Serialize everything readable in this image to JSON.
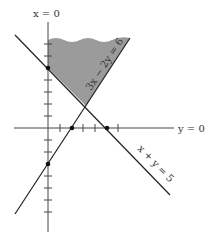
{
  "diagram": {
    "type": "linear-inequality-region",
    "axes": {
      "vertical_label": "x = 0",
      "horizontal_label": "y = 0"
    },
    "lines": [
      {
        "label": "3x − 2y = 6",
        "x_intercept": 2,
        "y_intercept": -3
      },
      {
        "label": "x + y = 5",
        "x_intercept": 5,
        "y_intercept": 5
      }
    ],
    "marked_points": [
      {
        "x": 0,
        "y": 5
      },
      {
        "x": 2,
        "y": 0
      },
      {
        "x": 5,
        "y": 0
      },
      {
        "x": 0,
        "y": -3
      }
    ],
    "shaded_region": {
      "description": "region above x + y = 5, left of 3x − 2y = 6, right of x = 0 (unbounded above)",
      "fill": "#9b9b9b"
    },
    "colors": {
      "line": "#222222",
      "axis": "#444444",
      "shade": "#9b9b9b"
    }
  }
}
